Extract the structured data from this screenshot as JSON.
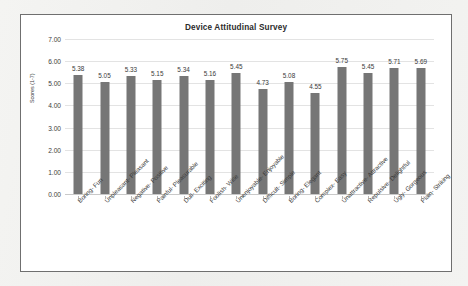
{
  "chart_data": {
    "type": "bar",
    "title": "Device Attitudinal Survey",
    "xlabel": "",
    "ylabel": "Scores (1-7)",
    "ylim": [
      0,
      7
    ],
    "ytick_step": 1,
    "ytick_labels": [
      "0.00",
      "1.00",
      "2.00",
      "3.00",
      "4.00",
      "5.00",
      "6.00",
      "7.00"
    ],
    "grid": true,
    "legend": "none",
    "bar_color": "#767676",
    "categories": [
      "Boring- Fun",
      "Unpleasant- Pleasant",
      "Negative- Positive",
      "Painful- Pleasurable",
      "Dull- Exciting",
      "Foolish- Wise",
      "Unenjoyable- Enjoyable",
      "Difficult- Simple",
      "Boring- Elegant",
      "Complex- Easy",
      "Unattractive- Attractive",
      "Repulsive- Delightful",
      "Ugly- Gorgeous",
      "Plain- Striking"
    ],
    "values": [
      5.38,
      5.05,
      5.33,
      5.15,
      5.34,
      5.16,
      5.45,
      4.73,
      5.08,
      4.55,
      5.75,
      5.45,
      5.71,
      5.69
    ],
    "value_labels": [
      "5.38",
      "5.05",
      "5.33",
      "5.15",
      "5.34",
      "5.16",
      "5.45",
      "4.73",
      "5.08",
      "4.55",
      "5.75",
      "5.45",
      "5.71",
      "5.69"
    ]
  }
}
